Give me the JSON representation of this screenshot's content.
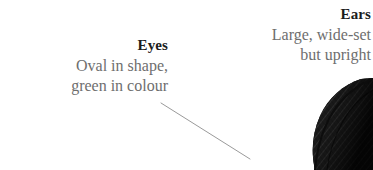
{
  "page": {
    "background_color": "#ffffff",
    "width": 373,
    "height": 170
  },
  "colors": {
    "heading_text": "#1c1c1c",
    "body_text": "#6e6e6e",
    "leader_line": "#9a9a9a",
    "illustration_ink": "#141414"
  },
  "callouts": [
    {
      "id": "eyes",
      "heading": "Eyes",
      "lines": [
        "Oval in shape,",
        "green in colour"
      ],
      "alignment": "right",
      "has_leader_line": true
    },
    {
      "id": "ears",
      "heading": "Ears",
      "lines": [
        "Large, wide-set",
        "but upright"
      ],
      "alignment": "right",
      "has_leader_line": false
    }
  ],
  "leader_line": {
    "from_x": 161,
    "from_y": 103,
    "to_x": 250,
    "to_y": 159,
    "color": "#9a9a9a",
    "width": 1
  },
  "illustration": {
    "name": "cat-ear-engraving",
    "description": "Cross-hatched ink engraving of a cat's ear",
    "ink_color": "#141414"
  }
}
